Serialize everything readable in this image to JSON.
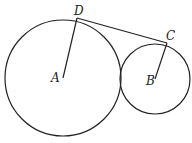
{
  "diagram": {
    "type": "geometry-tangent-circles",
    "circles": [
      {
        "name": "A",
        "cx": 63,
        "cy": 78,
        "r": 58
      },
      {
        "name": "B",
        "cx": 155,
        "cy": 79,
        "r": 35
      }
    ],
    "points": {
      "D": {
        "x": 77,
        "y": 18
      },
      "C": {
        "x": 167,
        "y": 43
      }
    },
    "segments": [
      {
        "from": "A",
        "to": "D"
      },
      {
        "from": "B",
        "to": "C"
      },
      {
        "from": "D",
        "to": "C"
      }
    ],
    "labels": {
      "A": "A",
      "B": "B",
      "C": "C",
      "D": "D"
    },
    "stroke_color": "#222222"
  }
}
